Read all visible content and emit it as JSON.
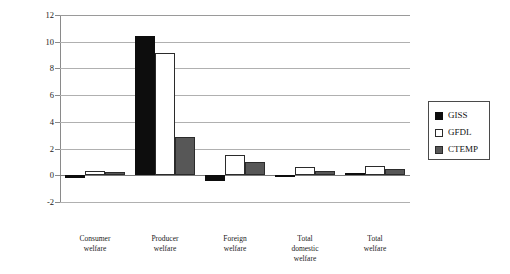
{
  "chart_data": {
    "type": "bar",
    "title": "",
    "subtitle": "",
    "xlabel": "",
    "ylabel": "",
    "ylim": [
      -2,
      12
    ],
    "ytick_labels": [
      "12",
      "10",
      "8",
      "6",
      "4",
      "2",
      "0",
      "-2"
    ],
    "yticks": [
      12,
      10,
      8,
      6,
      4,
      2,
      0,
      -2
    ],
    "grid": true,
    "grid_axis": "y",
    "legend_position": "right",
    "categories": [
      "Consumer welfare",
      "Producer welfare",
      "Foreign welfare",
      "Total domestic welfare",
      "Total welfare"
    ],
    "category_lines": [
      [
        "Consumer",
        "welfare"
      ],
      [
        "Producer",
        "welfare"
      ],
      [
        "Foreign",
        "welfare"
      ],
      [
        "Total",
        "domestic",
        "welfare"
      ],
      [
        "Total",
        "welfare"
      ]
    ],
    "series": [
      {
        "name": "GISS",
        "color": "#0d0d0d",
        "values": [
          -0.2,
          10.4,
          -0.45,
          0.02,
          0.15
        ]
      },
      {
        "name": "GFDL",
        "color": "#ffffff",
        "values": [
          0.35,
          9.15,
          1.55,
          0.6,
          0.7
        ]
      },
      {
        "name": "CTEMP",
        "color": "#575757",
        "values": [
          0.22,
          2.9,
          1.0,
          0.35,
          0.45
        ]
      }
    ]
  },
  "legend": {
    "entries": [
      {
        "label": "GISS",
        "swatch": "filled-black"
      },
      {
        "label": "GFDL",
        "swatch": "outlined-white"
      },
      {
        "label": "CTEMP",
        "swatch": "filled-gray"
      }
    ]
  },
  "colors": {
    "giss": "#0d0d0d",
    "gfdl": "#ffffff",
    "ctemp": "#575757",
    "gridline": "#b0b0b0",
    "axis": "#8a8a8a",
    "text": "#1a1a1a",
    "background": "#ffffff"
  }
}
